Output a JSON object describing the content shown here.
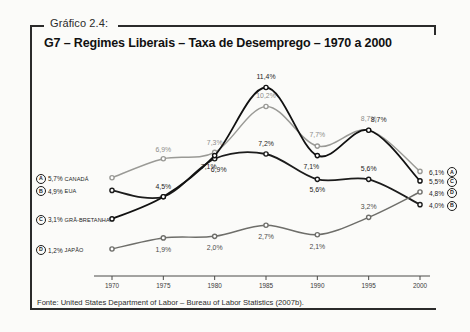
{
  "figure": {
    "caption_number": "Gráfico 2.4:",
    "title": "G7 – Regimes Liberais – Taxa de Desemprego – 1970 a 2000",
    "source": "Fonte: United States Department of Labor – Bureau of Labor Statistics (2007b)."
  },
  "legend_left": [
    {
      "badge": "A",
      "value": "5,7%",
      "country": "CANADÁ"
    },
    {
      "badge": "B",
      "value": "4,9%",
      "country": "EUA"
    },
    {
      "badge": "C",
      "value": "3,1%",
      "country": "GRÃ-BRETANHA"
    },
    {
      "badge": "D",
      "value": "1,2%",
      "country": "JAPÃO"
    }
  ],
  "legend_right": [
    {
      "value": "6,1%",
      "badge": "A"
    },
    {
      "value": "5,5%",
      "badge": "C"
    },
    {
      "value": "4,8%",
      "badge": "D"
    },
    {
      "value": "4,0%",
      "badge": "B"
    }
  ],
  "chart_data": {
    "type": "line",
    "title": "G7 – Regimes Liberais – Taxa de Desemprego – 1970 a 2000",
    "xlabel": "",
    "ylabel": "",
    "categories": [
      "1970",
      "1975",
      "1980",
      "1985",
      "1990",
      "1995",
      "2000"
    ],
    "x": [
      1970,
      1975,
      1980,
      1985,
      1990,
      1995,
      2000
    ],
    "ylim": [
      0,
      12
    ],
    "xlim": [
      1970,
      2000
    ],
    "grid": false,
    "legend_position": "inline-endpoints",
    "series": [
      {
        "name": "CANADÁ",
        "key": "A",
        "color": "#9a9a96",
        "values": [
          5.7,
          6.9,
          7.3,
          10.2,
          7.7,
          8.7,
          6.1
        ],
        "labels": [
          "5,7%",
          "6,9%",
          "7,3%",
          "10,2%",
          "7,7%",
          "8,7%",
          "6,1%"
        ]
      },
      {
        "name": "EUA",
        "key": "B",
        "color": "#1c1c1c",
        "values": [
          4.9,
          4.5,
          6.9,
          7.2,
          5.6,
          5.6,
          4.0
        ],
        "labels": [
          "4,9%",
          "4,5%",
          "6,9%",
          "7,2%",
          "5,6%",
          "5,6%",
          "4,0%"
        ]
      },
      {
        "name": "GRÃ-BRETANHA",
        "key": "C",
        "color": "#111111",
        "values": [
          3.1,
          4.5,
          7.1,
          11.4,
          7.1,
          8.7,
          5.5
        ],
        "labels": [
          "3,1%",
          "4,5%",
          "7,1%",
          "11,4%",
          "7,1%",
          "8,7%",
          "5,5%"
        ]
      },
      {
        "name": "JAPÃO",
        "key": "D",
        "color": "#6e6e6a",
        "values": [
          1.2,
          1.9,
          2.0,
          2.7,
          2.1,
          3.2,
          4.8
        ],
        "labels": [
          "1,2%",
          "1,9%",
          "2,0%",
          "2,7%",
          "2,1%",
          "3,2%",
          "4,8%"
        ]
      }
    ]
  },
  "axis": {
    "ticks": [
      "1970",
      "1975",
      "1980",
      "1985",
      "1990",
      "1995",
      "2000"
    ]
  },
  "colors": {
    "canada": "#9a9a96",
    "eua": "#1c1c1c",
    "gra_bretanha": "#111111",
    "japao": "#6e6e6a",
    "frame": "#2b2b2b",
    "background": "#fbfbf9"
  }
}
